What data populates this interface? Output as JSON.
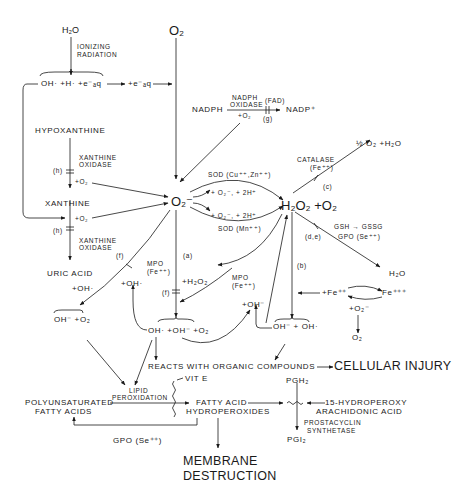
{
  "diagram": {
    "type": "free-radical-pathways",
    "nodes": {
      "h2o_top": "H₂O",
      "ionizing": "IONIZING",
      "radiation": "RADIATION",
      "radiolysis_products": "OH·  +H·  +e⁻ₐq",
      "eaq": "+e⁻ₐq",
      "o2_top": "O₂",
      "nadph_left": "NADPH",
      "nadph_oxidase_1": "NADPH",
      "nadph_oxidase_2": "OXIDASE",
      "fad": "(FAD)",
      "nadp_plus": "NADP⁺",
      "plus_o2_nadph": "+O₂",
      "g_label": "(g)",
      "hypoxanthine": "HYPOXANTHINE",
      "xo_1a": "XANTHINE",
      "xo_1b": "OXIDASE",
      "h_label_1": "(h)",
      "plus_o2_x1": "+O₂",
      "xanthine": "XANTHINE",
      "plus_o2_x2": "+O₂",
      "h_label_2": "(h)",
      "xo_2a": "XANTHINE",
      "xo_2b": "OXIDASE",
      "uric_acid": "URIC  ACID",
      "plus_oh_left": "+OH·",
      "superoxide": "O₂⁻",
      "sod_cuzn": "SOD (Cu⁺⁺,Zn⁺⁺)",
      "plus_o2_2h_1": "+ O₂⁻,  + 2H⁺",
      "plus_o2_2h_2": "+ O₂⁻,  + 2H⁺",
      "sod_mn": "SOD (Mn⁺⁺)",
      "h2o2_o2": "H₂O₂ +O₂",
      "catalase": "CATALASE",
      "catalase_fe": "(Fe⁺⁺)",
      "c_label": "(c)",
      "half_o2_h2o": "½ O₂  +H₂O",
      "gsh_gssg": "GSH → GSSG",
      "gpo_se_top": "GPO (Se⁺⁺)",
      "de_label": "(d,e)",
      "h2o_right": "H₂O",
      "a_label": "(a)",
      "b_label": "(b)",
      "f_label_1": "(f)",
      "f_label_2": "(f)",
      "mpo_1": "MPO",
      "mpo_fe_1": "(Fe⁺⁺)",
      "mpo_2": "MPO",
      "mpo_fe_2": "(Fe⁺⁺)",
      "plus_h2o2": "+H₂O₂",
      "plus_oh_mid": "+OH·",
      "oh_minus_o2": "OH⁻ +O₂",
      "oh_oh_o2": "OH·  +OH⁻  +O₂",
      "plus_oh_minus": "+OH⁻",
      "oh_minus_oh": "OH⁻ + OH·",
      "fe2": "+Fe⁺⁺",
      "fe3": "Fe⁺⁺⁺",
      "plus_o2_minus": "+O₂⁻",
      "o2_bottom": "O₂",
      "reacts": "REACTS  WITH  ORGANIC  COMPOUNDS",
      "cellular_injury": "CELLULAR INJURY",
      "lipid": "LIPID",
      "peroxidation": "PEROXIDATION",
      "vit_e": "VIT E",
      "pufa_1": "POLYUNSATURATED",
      "pufa_2": "FATTY  ACIDS",
      "fa_hp_1": "FATTY ACID",
      "fa_hp_2": "HYDROPEROXIDES",
      "gpo_se_bottom": "GPO (Se⁺⁺)",
      "pgh2": "PGH₂",
      "hpeta_1": "15-HYDROPEROXY",
      "hpeta_2": "ARACHIDONIC ACID",
      "prostacyclin_1": "PROSTACYCLIN",
      "prostacyclin_2": "SYNTHETASE",
      "pgi2": "PGI₂",
      "membrane_1": "MEMBRANE",
      "membrane_2": "DESTRUCTION"
    }
  }
}
